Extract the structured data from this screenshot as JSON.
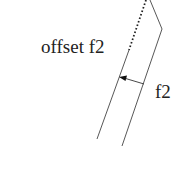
{
  "diagram": {
    "labels": {
      "offset": "offset f2",
      "distance": "f2"
    },
    "colors": {
      "stroke": "#444444",
      "text": "#222222",
      "background": "#ffffff"
    },
    "elements": {
      "original_curve": "f2 (solid polyline)",
      "offset_curve": "offset f2 (dotted then solid)",
      "offset_arrow": "arrow from f2 to offset f2"
    }
  }
}
